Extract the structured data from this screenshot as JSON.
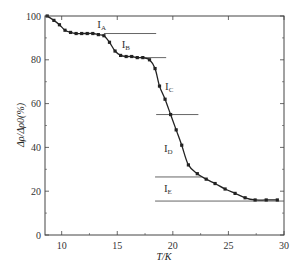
{
  "chart_data": {
    "type": "line",
    "title": "",
    "xlabel": "T/K",
    "ylabel": "Δρ/Δρ0(%)",
    "xlim": [
      8.5,
      30
    ],
    "ylim": [
      0,
      100
    ],
    "grid": false,
    "legend": null,
    "x_ticks": [
      10,
      15,
      20,
      25,
      30
    ],
    "y_ticks": [
      0,
      20,
      40,
      60,
      80,
      100
    ],
    "series": [
      {
        "name": "Δρ/Δρ0",
        "marker": "square",
        "color": "#222222",
        "x": [
          8.7,
          9.3,
          9.8,
          10.3,
          10.8,
          11.3,
          11.8,
          12.3,
          12.8,
          13.3,
          13.8,
          14.3,
          14.8,
          15.3,
          15.8,
          16.3,
          16.8,
          17.3,
          17.9,
          18.4,
          18.8,
          19.3,
          19.8,
          20.3,
          20.8,
          21.4,
          22.2,
          23.0,
          23.8,
          24.7,
          25.6,
          26.5,
          27.4,
          28.4,
          29.4
        ],
        "y": [
          100,
          98,
          96,
          93.5,
          92.5,
          92,
          92,
          92,
          92,
          91.5,
          91,
          88,
          84,
          82,
          81.5,
          81.5,
          81,
          81,
          80,
          76,
          68,
          62,
          55,
          48,
          41,
          32,
          28,
          25.5,
          23.5,
          21,
          19,
          17,
          16,
          16,
          16
        ]
      }
    ],
    "annotations": [
      {
        "text": "I",
        "sub": "A",
        "x": 13.2,
        "y": 94.5
      },
      {
        "text": "I",
        "sub": "B",
        "x": 15.4,
        "y": 85.5
      },
      {
        "text": "I",
        "sub": "C",
        "x": 19.3,
        "y": 66
      },
      {
        "text": "I",
        "sub": "D",
        "x": 19.2,
        "y": 38
      },
      {
        "text": "I",
        "sub": "E",
        "x": 19.2,
        "y": 19.5
      }
    ],
    "reference_lines": [
      {
        "y": 92,
        "x_from": 13.8,
        "x_to": 18.5
      },
      {
        "y": 81,
        "x_from": 16.7,
        "x_to": 19.4
      },
      {
        "y": 55,
        "x_from": 18.5,
        "x_to": 22.3
      },
      {
        "y": 26.5,
        "x_from": 18.4,
        "x_to": 22.6
      },
      {
        "y": 15.5,
        "x_from": 18.4,
        "x_to": 30
      }
    ]
  }
}
